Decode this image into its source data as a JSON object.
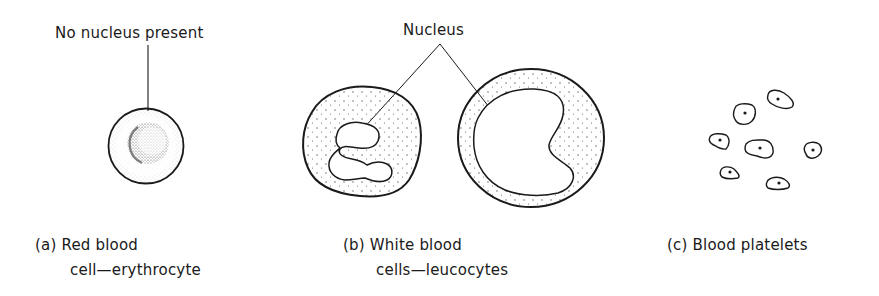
{
  "figure": {
    "panels": [
      {
        "id": "a",
        "caption_line1": "(a) Red blood",
        "caption_line2": "cell—erythrocyte",
        "annotation": "No nucleus present",
        "subject": "red-blood-cell"
      },
      {
        "id": "b",
        "caption_line1": "(b) White blood",
        "caption_line2": "cells—leucocytes",
        "annotation": "Nucleus",
        "subject": "white-blood-cells"
      },
      {
        "id": "c",
        "caption_line1": "(c) Blood platelets",
        "subject": "blood-platelets",
        "platelet_count": 7
      }
    ]
  },
  "colors": {
    "ink": "#1a1a1a",
    "background": "#ffffff"
  }
}
